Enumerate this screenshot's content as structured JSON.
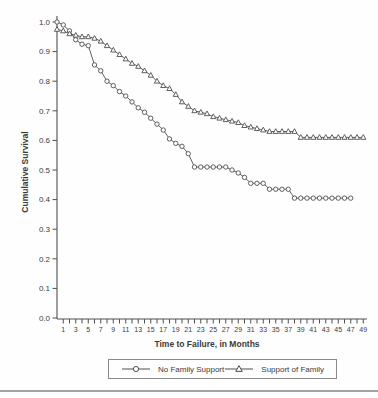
{
  "figure": {
    "background_color": "#fefefe",
    "line_color": "#4f4f4f",
    "text_color": "#3a3a3a",
    "bottom_rule_color": "#a2a2a2"
  },
  "chart_data": {
    "type": "line",
    "title": "",
    "xlabel": "Time to Failure, in Months",
    "ylabel": "Cumulative Survival",
    "xlim": [
      0,
      49.6
    ],
    "ylim": [
      0.0,
      1.0
    ],
    "grid": false,
    "legend_position": "bottom",
    "x_tick_labels": [
      1,
      3,
      5,
      7,
      9,
      11,
      13,
      15,
      17,
      19,
      21,
      23,
      25,
      27,
      29,
      31,
      33,
      35,
      37,
      39,
      41,
      43,
      45,
      47,
      49
    ],
    "x_minor_ticks": {
      "from": 1,
      "to": 49,
      "step": 1
    },
    "y_ticks": [
      0.0,
      0.1,
      0.2,
      0.3,
      0.4,
      0.5,
      0.6,
      0.7,
      0.8,
      0.9,
      1.0
    ],
    "series": [
      {
        "name": "No Family Support",
        "marker": "circle",
        "x": [
          0,
          1,
          2,
          3,
          4,
          5,
          6,
          7,
          8,
          9,
          10,
          11,
          12,
          13,
          14,
          15,
          16,
          17,
          18,
          19,
          20,
          21,
          22,
          23,
          24,
          25,
          26,
          27,
          28,
          29,
          30,
          31,
          32,
          33,
          34,
          35,
          36,
          37,
          38,
          39,
          40,
          41,
          42,
          43,
          44,
          45,
          46,
          47
        ],
        "y": [
          1.0,
          0.99,
          0.97,
          0.94,
          0.925,
          0.92,
          0.855,
          0.835,
          0.8,
          0.785,
          0.765,
          0.75,
          0.73,
          0.71,
          0.695,
          0.675,
          0.655,
          0.635,
          0.605,
          0.59,
          0.58,
          0.555,
          0.51,
          0.51,
          0.51,
          0.51,
          0.51,
          0.51,
          0.5,
          0.49,
          0.475,
          0.455,
          0.455,
          0.455,
          0.435,
          0.435,
          0.435,
          0.435,
          0.405,
          0.405,
          0.405,
          0.405,
          0.405,
          0.405,
          0.405,
          0.405,
          0.405,
          0.405
        ]
      },
      {
        "name": "Support of Family",
        "marker": "triangle",
        "x": [
          0,
          1,
          2,
          3,
          4,
          5,
          6,
          7,
          8,
          9,
          10,
          11,
          12,
          13,
          14,
          15,
          16,
          17,
          18,
          19,
          20,
          21,
          22,
          23,
          24,
          25,
          26,
          27,
          28,
          29,
          30,
          31,
          32,
          33,
          34,
          35,
          36,
          37,
          38,
          39,
          40,
          41,
          42,
          43,
          44,
          45,
          46,
          47,
          48,
          49
        ],
        "y": [
          0.975,
          0.97,
          0.96,
          0.955,
          0.95,
          0.95,
          0.945,
          0.935,
          0.92,
          0.905,
          0.89,
          0.875,
          0.86,
          0.85,
          0.835,
          0.82,
          0.8,
          0.785,
          0.775,
          0.755,
          0.73,
          0.715,
          0.7,
          0.695,
          0.69,
          0.68,
          0.675,
          0.67,
          0.665,
          0.66,
          0.65,
          0.645,
          0.64,
          0.635,
          0.63,
          0.63,
          0.63,
          0.63,
          0.63,
          0.61,
          0.61,
          0.61,
          0.61,
          0.61,
          0.61,
          0.61,
          0.61,
          0.61,
          0.61,
          0.61
        ]
      }
    ]
  }
}
